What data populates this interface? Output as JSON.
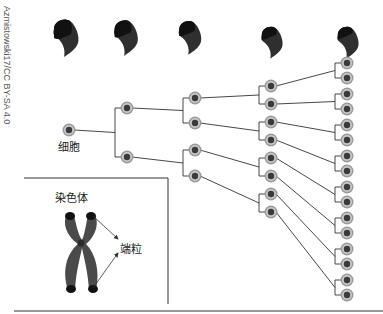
{
  "credit": "Azmistowski17/CC BY-SA 4.0",
  "labels": {
    "cell": "细胞",
    "chromosome": "染色体",
    "telomere": "端粒"
  },
  "colors": {
    "line": "#333333",
    "cell_outer": "#9a9a9a",
    "cell_ring": "#c8c8c8",
    "cell_nucleus": "#3a3a3a",
    "telomere_shape": "#2f2f2f",
    "telomere_tip": "#111111",
    "chromosome": "#4a4a4a"
  },
  "generations": [
    {
      "x": 69,
      "ys": [
        130
      ]
    },
    {
      "x": 127,
      "ys": [
        108,
        157
      ]
    },
    {
      "x": 195,
      "ys": [
        98,
        123,
        150,
        176
      ]
    },
    {
      "x": 271,
      "ys": [
        86,
        104,
        122,
        140,
        158,
        176,
        194,
        212
      ]
    },
    {
      "x": 347,
      "ys": [
        63,
        78,
        94,
        109,
        125,
        140,
        156,
        171,
        187,
        202,
        218,
        233,
        249,
        264,
        280,
        295
      ]
    }
  ],
  "telomere_icons": [
    {
      "x": 66,
      "y": 35,
      "scale": 1.0
    },
    {
      "x": 126,
      "y": 35,
      "scale": 0.95
    },
    {
      "x": 190,
      "y": 35,
      "scale": 0.9
    },
    {
      "x": 272,
      "y": 40,
      "scale": 0.85
    },
    {
      "x": 348,
      "y": 40,
      "scale": 0.85
    }
  ]
}
